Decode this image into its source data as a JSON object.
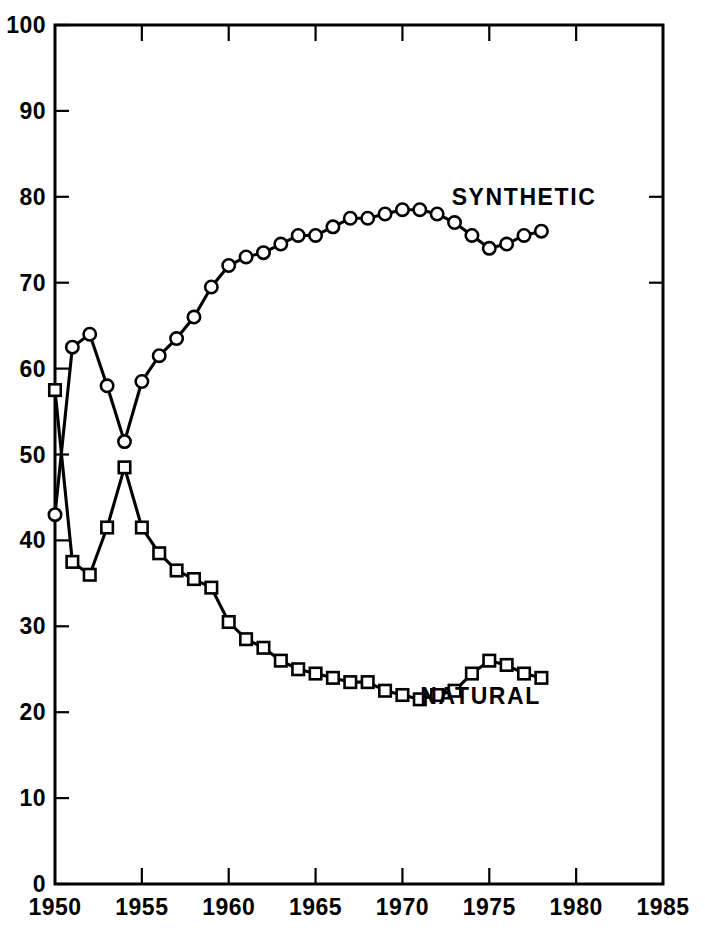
{
  "chart_data": {
    "type": "line",
    "title": "",
    "subtitle": "",
    "xlabel": "",
    "ylabel": "",
    "xlim": [
      1950,
      1985
    ],
    "ylim": [
      0,
      100
    ],
    "grid": false,
    "legend_position": "inline-right-of-series",
    "x_ticks": [
      1950,
      1955,
      1960,
      1965,
      1970,
      1975,
      1980,
      1985
    ],
    "x_tick_labels": [
      "1950",
      "1955",
      "1960",
      "1965",
      "1970",
      "1975",
      "1980",
      "1985"
    ],
    "y_ticks": [
      0,
      10,
      20,
      30,
      40,
      50,
      60,
      70,
      80,
      90,
      100
    ],
    "y_tick_labels": [
      "0",
      "10",
      "20",
      "30",
      "40",
      "50",
      "60",
      "70",
      "80",
      "90",
      "100"
    ],
    "series": [
      {
        "name": "SYNTHETIC",
        "marker": "circle",
        "label_x": 1977.0,
        "label_y": 79.0,
        "x": [
          1950,
          1951,
          1952,
          1953,
          1954,
          1955,
          1956,
          1957,
          1958,
          1959,
          1960,
          1961,
          1962,
          1963,
          1964,
          1965,
          1966,
          1967,
          1968,
          1969,
          1970,
          1971,
          1972,
          1973,
          1974,
          1975,
          1976,
          1977,
          1978
        ],
        "values": [
          43.0,
          62.5,
          64.0,
          58.0,
          51.5,
          58.5,
          61.5,
          63.5,
          66.0,
          69.5,
          72.0,
          73.0,
          73.5,
          74.5,
          75.5,
          75.5,
          76.5,
          77.5,
          77.5,
          78.0,
          78.5,
          78.5,
          78.0,
          77.0,
          75.5,
          74.0,
          74.5,
          75.5,
          76.0
        ]
      },
      {
        "name": "NATURAL",
        "marker": "square",
        "label_x": 1974.5,
        "label_y": 21.0,
        "x": [
          1950,
          1951,
          1952,
          1953,
          1954,
          1955,
          1956,
          1957,
          1958,
          1959,
          1960,
          1961,
          1962,
          1963,
          1964,
          1965,
          1966,
          1967,
          1968,
          1969,
          1970,
          1971,
          1972,
          1973,
          1974,
          1975,
          1976,
          1977,
          1978
        ],
        "values": [
          57.5,
          37.5,
          36.0,
          41.5,
          48.5,
          41.5,
          38.5,
          36.5,
          35.5,
          34.5,
          30.5,
          28.5,
          27.5,
          26.0,
          25.0,
          24.5,
          24.0,
          23.5,
          23.5,
          22.5,
          22.0,
          21.5,
          22.0,
          22.5,
          24.5,
          26.0,
          25.5,
          24.5,
          24.0
        ]
      }
    ]
  },
  "labels": {
    "synthetic": "SYNTHETIC",
    "natural": "NATURAL"
  }
}
